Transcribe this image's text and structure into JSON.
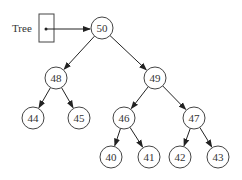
{
  "pointer": {
    "label": "Tree"
  },
  "nodes": [
    {
      "id": "n50",
      "value": "50",
      "x": 102,
      "y": 28
    },
    {
      "id": "n48",
      "value": "48",
      "x": 56,
      "y": 78
    },
    {
      "id": "n49",
      "value": "49",
      "x": 155,
      "y": 78
    },
    {
      "id": "n44",
      "value": "44",
      "x": 33,
      "y": 118
    },
    {
      "id": "n45",
      "value": "45",
      "x": 79,
      "y": 118
    },
    {
      "id": "n46",
      "value": "46",
      "x": 124,
      "y": 118
    },
    {
      "id": "n47",
      "value": "47",
      "x": 194,
      "y": 118
    },
    {
      "id": "n40",
      "value": "40",
      "x": 111,
      "y": 157
    },
    {
      "id": "n41",
      "value": "41",
      "x": 149,
      "y": 157
    },
    {
      "id": "n42",
      "value": "42",
      "x": 180,
      "y": 157
    },
    {
      "id": "n43",
      "value": "43",
      "x": 218,
      "y": 157
    }
  ],
  "edges": [
    [
      "n50",
      "n48"
    ],
    [
      "n50",
      "n49"
    ],
    [
      "n48",
      "n44"
    ],
    [
      "n48",
      "n45"
    ],
    [
      "n49",
      "n46"
    ],
    [
      "n49",
      "n47"
    ],
    [
      "n46",
      "n40"
    ],
    [
      "n46",
      "n41"
    ],
    [
      "n47",
      "n42"
    ],
    [
      "n47",
      "n43"
    ]
  ]
}
